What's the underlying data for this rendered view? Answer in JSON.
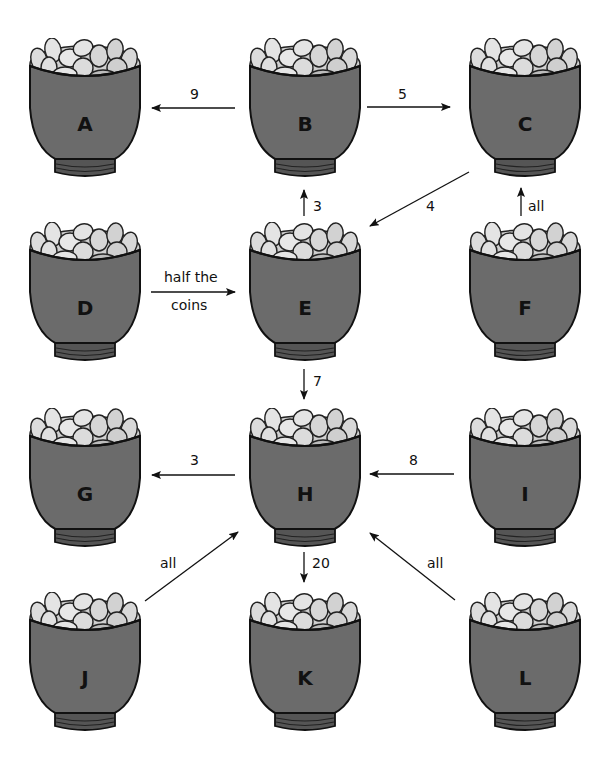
{
  "diagram": {
    "type": "coin-transfer-flow",
    "pot_color": "#6b6b6b",
    "coin_color": "#d9d9d9",
    "pots": [
      {
        "id": "A",
        "label": "A",
        "x": 25,
        "y": 38
      },
      {
        "id": "B",
        "label": "B",
        "x": 245,
        "y": 38
      },
      {
        "id": "C",
        "label": "C",
        "x": 465,
        "y": 38
      },
      {
        "id": "D",
        "label": "D",
        "x": 25,
        "y": 222
      },
      {
        "id": "E",
        "label": "E",
        "x": 245,
        "y": 222
      },
      {
        "id": "F",
        "label": "F",
        "x": 465,
        "y": 222
      },
      {
        "id": "G",
        "label": "G",
        "x": 25,
        "y": 408
      },
      {
        "id": "H",
        "label": "H",
        "x": 245,
        "y": 408
      },
      {
        "id": "I",
        "label": "I",
        "x": 465,
        "y": 408
      },
      {
        "id": "J",
        "label": "J",
        "x": 25,
        "y": 592
      },
      {
        "id": "K",
        "label": "K",
        "x": 245,
        "y": 592
      },
      {
        "id": "L",
        "label": "L",
        "x": 465,
        "y": 592
      }
    ],
    "edges": [
      {
        "from": "B",
        "to": "A",
        "label": "9"
      },
      {
        "from": "B",
        "to": "C",
        "label": "5"
      },
      {
        "from": "E",
        "to": "B",
        "label": "3"
      },
      {
        "from": "C",
        "to": "E",
        "label": "4"
      },
      {
        "from": "F",
        "to": "C",
        "label": "all"
      },
      {
        "from": "D",
        "to": "E",
        "label_line1": "half the",
        "label_line2": "coins"
      },
      {
        "from": "E",
        "to": "H",
        "label": "7"
      },
      {
        "from": "H",
        "to": "G",
        "label": "3"
      },
      {
        "from": "I",
        "to": "H",
        "label": "8"
      },
      {
        "from": "J",
        "to": "H",
        "label": "all"
      },
      {
        "from": "H",
        "to": "K",
        "label": "20"
      },
      {
        "from": "L",
        "to": "H",
        "label": "all"
      }
    ]
  }
}
